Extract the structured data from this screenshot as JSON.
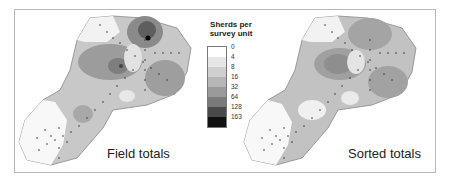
{
  "figure": {
    "left_map": {
      "caption": "Field totals"
    },
    "right_map": {
      "caption": "Sorted totals"
    },
    "legend": {
      "title_line1": "Sherds per",
      "title_line2": "survey unit",
      "classes": [
        {
          "label": "0",
          "color": "#ffffff"
        },
        {
          "label": "4",
          "color": "#e6e6e6"
        },
        {
          "label": "8",
          "color": "#cfcfcf"
        },
        {
          "label": "16",
          "color": "#b6b6b6"
        },
        {
          "label": "32",
          "color": "#9a9a9a"
        },
        {
          "label": "64",
          "color": "#7a7a7a"
        },
        {
          "label": "128",
          "color": "#4a4a4a"
        },
        {
          "label": "163",
          "color": "#111111"
        }
      ]
    }
  }
}
